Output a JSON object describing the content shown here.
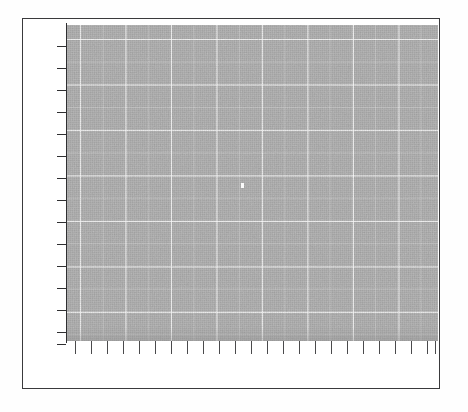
{
  "figure": {
    "kind": "plot-panel",
    "title": "",
    "caption": "",
    "paper_color": "#ffffff",
    "frame_color": "#3a3a3c",
    "panel_fill": "#a9a9a9",
    "gridline_color": "#ffffff",
    "axis_color": "#2f2f31",
    "tick_color": "#4a4a4c"
  },
  "frame": {
    "x": 22,
    "y": 18,
    "width": 418,
    "height": 371
  },
  "panel": {
    "x": 66,
    "y": 24,
    "width": 371,
    "height": 316,
    "speck": {
      "x": 174,
      "y": 158
    }
  },
  "chart_data": {
    "type": "scatter",
    "title": "",
    "subtitle": "",
    "xlabel": "",
    "ylabel": "",
    "series": [
      {
        "name": "",
        "x": [],
        "y": [],
        "values": []
      }
    ],
    "categories": [],
    "values": [],
    "annotations": [],
    "legend": {
      "entries": [],
      "position": "none",
      "visible": false
    },
    "grid": {
      "visible": true,
      "color": "#ffffff",
      "major_spacing_px": 45.5,
      "minor_spacing_px": 22.7,
      "major_x_count": 8,
      "major_y_count": 7
    },
    "panel_background": "#a9a9a9",
    "xaxis": {
      "visible": true,
      "spine": false,
      "tick_count": 24,
      "tick_labels": [],
      "tick_length_px": 13,
      "tick_side": "outside-below",
      "range": [
        0,
        24
      ]
    },
    "yaxis": {
      "visible": true,
      "spine": true,
      "tick_count": 15,
      "tick_labels": [],
      "tick_length_px": 9,
      "tick_side": "outside-left",
      "range": [
        0,
        15
      ]
    },
    "note": "Empty plotting panel: uniform gray halftone field with white gridlines; no data marks, labels, or legend are rendered."
  },
  "ticks": {
    "y_positions": [
      27,
      49,
      71,
      93,
      115,
      137,
      159,
      181,
      203,
      225,
      247,
      269,
      291,
      313,
      325
    ],
    "x_positions": [
      8,
      24,
      40,
      56,
      72,
      88,
      104,
      120,
      136,
      152,
      168,
      184,
      200,
      216,
      232,
      248,
      264,
      280,
      296,
      312,
      328,
      344,
      360,
      368
    ]
  }
}
